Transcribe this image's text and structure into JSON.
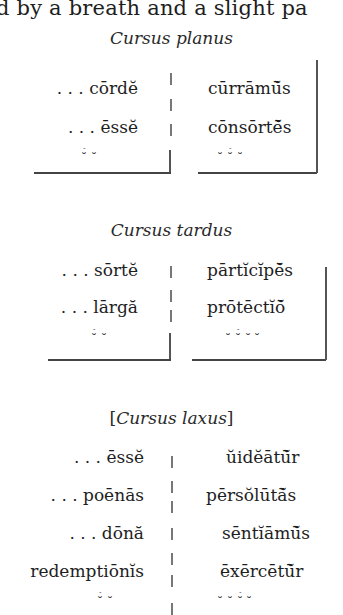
{
  "top_line": "d by a breath and a slight pa",
  "sections": [
    {
      "heading": "Cursus planus",
      "rows": [
        {
          "left": ". . . cōrdĕ",
          "right": "cūrrāmū̆s"
        },
        {
          "left": ". . . ēssĕ",
          "right": "cōnsōrtē̆s"
        }
      ],
      "marks": {
        "left": "⏑́   ⏑",
        "right": "⏑   ⏑́   ⏑"
      }
    },
    {
      "heading": "Cursus tardus",
      "rows": [
        {
          "left": ". . . sōrtĕ",
          "right": "pārtĭcĭpē̆s"
        },
        {
          "left": ". . . lārgă",
          "right": "prōtēctĭō̆"
        }
      ],
      "marks": {
        "left": "⏑́   ⏑",
        "right": "⏑ ⏑́  ⏑ ⏑"
      }
    },
    {
      "heading_prefix": "[",
      "heading": "Cursus laxus",
      "heading_suffix": "]",
      "rows": [
        {
          "left": ". . . ēssĕ",
          "right": "ŭidĕātū̆r"
        },
        {
          "left": ". . . poēnās",
          "right": "pērsŏlūtā̆s"
        },
        {
          "left": ". . . dōnă",
          "right": "sēntĭāmū̆s"
        },
        {
          "left": "redemptiōnĭs",
          "right": "ēxērcētū̆r"
        }
      ],
      "marks": {
        "left": "⏑́  ⏑",
        "right": "⏑  ⏑   ⏑́  ⏑"
      }
    }
  ]
}
